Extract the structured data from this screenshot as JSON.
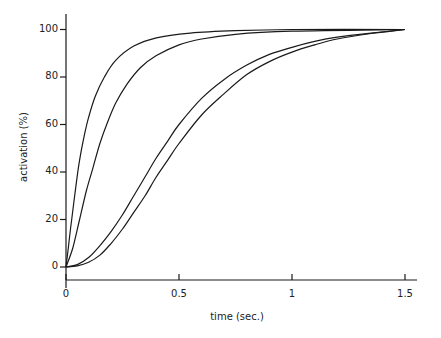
{
  "chart_data": {
    "type": "line",
    "title": "",
    "xlabel": "time (sec.)",
    "ylabel": "activation (%)",
    "xlim": [
      0,
      1.5
    ],
    "ylim": [
      0,
      100
    ],
    "x_ticks": [
      0,
      0.5,
      1,
      1.5
    ],
    "x_tick_labels": [
      "0",
      "0.5",
      "1",
      "1.5"
    ],
    "y_ticks": [
      0,
      20,
      40,
      60,
      80,
      100
    ],
    "y_tick_labels": [
      "0",
      "20",
      "40",
      "60",
      "80",
      "100"
    ],
    "grid": false,
    "legend": null,
    "series": [
      {
        "name": "curve 1",
        "points": [
          [
            0,
            0
          ],
          [
            0.01,
            8
          ],
          [
            0.025,
            20
          ],
          [
            0.045,
            35
          ],
          [
            0.06,
            45
          ],
          [
            0.08,
            55
          ],
          [
            0.1,
            63
          ],
          [
            0.13,
            72
          ],
          [
            0.17,
            80
          ],
          [
            0.22,
            87
          ],
          [
            0.3,
            93
          ],
          [
            0.4,
            96.5
          ],
          [
            0.55,
            98.5
          ],
          [
            0.75,
            99.5
          ],
          [
            1.0,
            100
          ],
          [
            1.5,
            100
          ]
        ]
      },
      {
        "name": "curve 2",
        "points": [
          [
            0,
            0
          ],
          [
            0.03,
            8
          ],
          [
            0.06,
            20
          ],
          [
            0.09,
            32
          ],
          [
            0.12,
            42
          ],
          [
            0.15,
            52
          ],
          [
            0.18,
            60
          ],
          [
            0.22,
            69
          ],
          [
            0.27,
            77
          ],
          [
            0.33,
            84
          ],
          [
            0.4,
            89
          ],
          [
            0.5,
            93.5
          ],
          [
            0.6,
            96
          ],
          [
            0.75,
            98
          ],
          [
            1.0,
            99.3
          ],
          [
            1.5,
            100
          ]
        ]
      },
      {
        "name": "curve 3",
        "points": [
          [
            0,
            0
          ],
          [
            0.05,
            1
          ],
          [
            0.1,
            4
          ],
          [
            0.15,
            9
          ],
          [
            0.2,
            15
          ],
          [
            0.25,
            22
          ],
          [
            0.3,
            30
          ],
          [
            0.35,
            38
          ],
          [
            0.4,
            46
          ],
          [
            0.45,
            53
          ],
          [
            0.5,
            60
          ],
          [
            0.6,
            71
          ],
          [
            0.7,
            79
          ],
          [
            0.8,
            85
          ],
          [
            0.9,
            89.5
          ],
          [
            1.0,
            92.5
          ],
          [
            1.1,
            95
          ],
          [
            1.2,
            96.8
          ],
          [
            1.35,
            98.5
          ],
          [
            1.5,
            100
          ]
        ]
      },
      {
        "name": "curve 4",
        "points": [
          [
            0,
            0
          ],
          [
            0.05,
            0.5
          ],
          [
            0.1,
            2
          ],
          [
            0.15,
            5
          ],
          [
            0.2,
            10
          ],
          [
            0.25,
            16
          ],
          [
            0.3,
            23
          ],
          [
            0.35,
            30
          ],
          [
            0.4,
            38
          ],
          [
            0.45,
            45
          ],
          [
            0.5,
            52
          ],
          [
            0.6,
            64
          ],
          [
            0.7,
            73
          ],
          [
            0.8,
            81
          ],
          [
            0.9,
            86.5
          ],
          [
            1.0,
            90.5
          ],
          [
            1.1,
            93.5
          ],
          [
            1.2,
            96
          ],
          [
            1.35,
            98.3
          ],
          [
            1.5,
            100
          ]
        ]
      }
    ]
  },
  "plot_area": {
    "x0": 66,
    "x1": 405,
    "y0": 267,
    "y1": 29.5,
    "x_axis_y": 280,
    "y_axis_top": 14
  },
  "colors": {
    "line": "#1a1a1a",
    "text": "#222222",
    "background": "#ffffff"
  }
}
